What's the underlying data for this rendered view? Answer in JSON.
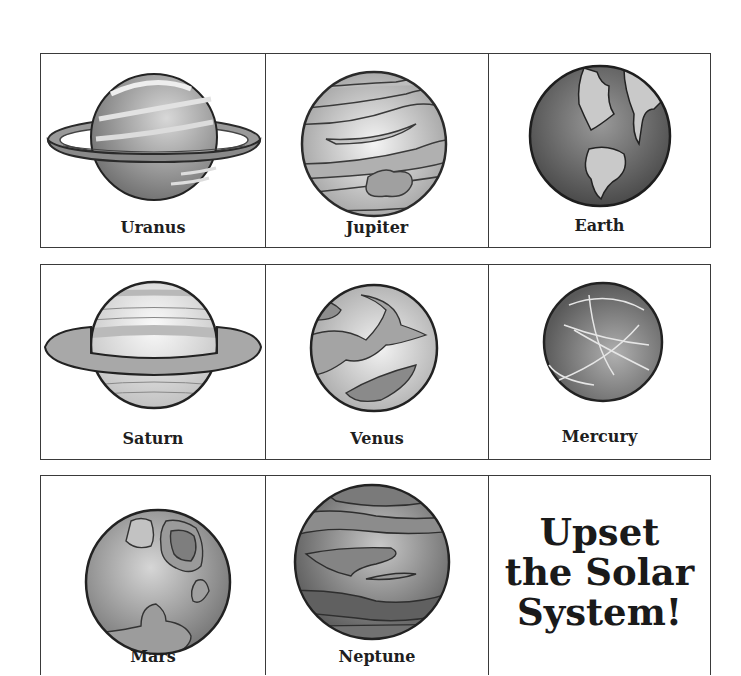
{
  "sheet": {
    "rows": [
      {
        "cards": [
          {
            "planet": "Uranus",
            "label": "Uranus"
          },
          {
            "planet": "Jupiter",
            "label": "Jupiter"
          },
          {
            "planet": "Earth",
            "label": "Earth"
          }
        ]
      },
      {
        "cards": [
          {
            "planet": "Saturn",
            "label": "Saturn"
          },
          {
            "planet": "Venus",
            "label": "Venus"
          },
          {
            "planet": "Mercury",
            "label": "Mercury"
          }
        ]
      },
      {
        "cards": [
          {
            "planet": "Mars",
            "label": "Mars"
          },
          {
            "planet": "Neptune",
            "label": "Neptune"
          }
        ]
      }
    ],
    "title_card": {
      "lines": [
        "Upset",
        "the Solar",
        "System!"
      ]
    }
  }
}
